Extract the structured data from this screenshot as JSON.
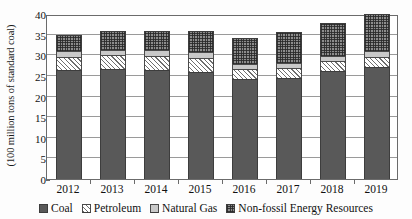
{
  "chart_data": {
    "type": "bar",
    "subtype": "stacked-bar",
    "title": "",
    "xlabel": "",
    "ylabel": "(100 million tons of standard coal)",
    "ylim": [
      0,
      40
    ],
    "ytick_step": 5,
    "yticks": [
      0,
      5,
      10,
      15,
      20,
      25,
      30,
      35,
      40
    ],
    "grid": true,
    "grid_axis": "y",
    "legend_position": "bottom",
    "categories": [
      "2012",
      "2013",
      "2014",
      "2015",
      "2016",
      "2017",
      "2018",
      "2019"
    ],
    "series": [
      {
        "name": "Coal",
        "color": "#595959",
        "pattern": "solid-dark",
        "values": [
          26.4,
          26.7,
          26.5,
          26.0,
          24.2,
          24.6,
          26.1,
          27.2
        ]
      },
      {
        "name": "Petroleum",
        "color": "#ffffff",
        "pattern": "diagonal-hatch",
        "values": [
          3.3,
          3.3,
          3.4,
          3.4,
          2.5,
          2.2,
          2.4,
          2.3
        ]
      },
      {
        "name": "Natural Gas",
        "color": "#c9c9c9",
        "pattern": "light-solid",
        "values": [
          1.3,
          1.2,
          1.3,
          1.4,
          1.3,
          1.3,
          1.4,
          1.5
        ]
      },
      {
        "name": "Non-fossil Energy Resources",
        "color": "#8d8d8d",
        "pattern": "checker",
        "values": [
          4.0,
          4.6,
          4.8,
          5.2,
          6.3,
          7.6,
          7.9,
          9.0
        ]
      }
    ],
    "totals": [
      35.0,
      35.8,
      36.0,
      36.0,
      34.3,
      35.7,
      37.8,
      40.0
    ]
  },
  "axes": {
    "y_title": "(100 million tons of standard coal)",
    "y_tick_labels": [
      "0",
      "5",
      "10",
      "15",
      "20",
      "25",
      "30",
      "35",
      "40"
    ],
    "x_tick_labels": [
      "2012",
      "2013",
      "2014",
      "2015",
      "2016",
      "2017",
      "2018",
      "2019"
    ]
  },
  "legend": {
    "items": [
      {
        "label": "Coal",
        "swatch": "coal-swatch"
      },
      {
        "label": "Petroleum",
        "swatch": "petroleum-swatch"
      },
      {
        "label": "Natural Gas",
        "swatch": "natural-gas-swatch"
      },
      {
        "label": "Non-fossil Energy Resources",
        "swatch": "non-fossil-swatch"
      }
    ]
  }
}
